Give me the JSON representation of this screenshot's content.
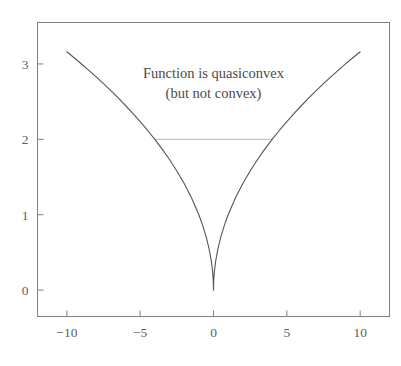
{
  "chart_data": {
    "type": "line",
    "title": "",
    "subtitle": "",
    "xlabel": "",
    "ylabel": "",
    "function": "sqrt(abs(x))",
    "xlim": [
      -12,
      12
    ],
    "ylim": [
      -0.35,
      3.55
    ],
    "grid": false,
    "legend": null,
    "x_ticks": [
      -10,
      -5,
      0,
      5,
      10
    ],
    "x_tick_labels": [
      "−10",
      "−5",
      "0",
      "5",
      "10"
    ],
    "y_ticks": [
      0,
      1,
      2,
      3
    ],
    "y_tick_labels": [
      "0",
      "1",
      "2",
      "3"
    ],
    "series": [
      {
        "name": "sqrt(|x|)",
        "color": "#555555",
        "x": [
          -10,
          -9.5,
          -9,
          -8.5,
          -8,
          -7.5,
          -7,
          -6.5,
          -6,
          -5.5,
          -5,
          -4.5,
          -4,
          -3.5,
          -3,
          -2.5,
          -2,
          -1.5,
          -1,
          -0.75,
          -0.5,
          -0.3,
          -0.15,
          -0.06,
          -0.015,
          0,
          0.015,
          0.06,
          0.15,
          0.3,
          0.5,
          0.75,
          1,
          1.5,
          2,
          2.5,
          3,
          3.5,
          4,
          4.5,
          5,
          5.5,
          6,
          6.5,
          7,
          7.5,
          8,
          8.5,
          9,
          9.5,
          10
        ],
        "y": [
          3.162,
          3.082,
          3.0,
          2.915,
          2.828,
          2.739,
          2.646,
          2.55,
          2.449,
          2.345,
          2.236,
          2.121,
          2.0,
          1.871,
          1.732,
          1.581,
          1.414,
          1.225,
          1.0,
          0.866,
          0.707,
          0.548,
          0.387,
          0.245,
          0.122,
          0.0,
          0.122,
          0.245,
          0.387,
          0.548,
          0.707,
          0.866,
          1.0,
          1.225,
          1.414,
          1.581,
          1.732,
          1.871,
          2.0,
          2.121,
          2.236,
          2.345,
          2.449,
          2.55,
          2.646,
          2.739,
          2.828,
          2.915,
          3.0,
          3.082,
          3.162
        ]
      }
    ],
    "sublevel_line": {
      "name": "sublevel-set-segment",
      "y": 2,
      "x_start": -4,
      "x_end": 4,
      "color": "#b8b8b8"
    },
    "annotations": [
      {
        "text": "Function is quasiconvex",
        "x": 0,
        "y": 2.82
      },
      {
        "text": "(but not convex)",
        "x": 0,
        "y": 2.55
      }
    ],
    "axis_color": "#808080",
    "tick_label_color": "#606060",
    "background_color": "#ffffff"
  },
  "axes": {
    "x_tick_labels": [
      "−10",
      "−5",
      "0",
      "5",
      "10"
    ],
    "y_tick_labels": [
      "0",
      "1",
      "2",
      "3"
    ]
  },
  "annotation": {
    "line1": "Function is quasiconvex",
    "line2": "(but not convex)"
  }
}
